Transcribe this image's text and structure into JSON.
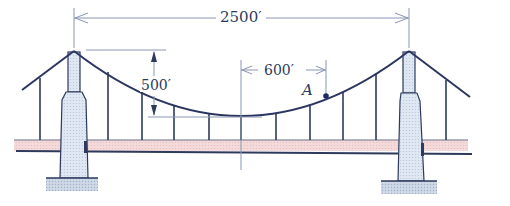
{
  "figure": {
    "type": "suspension-bridge-diagram",
    "dimensions": {
      "span_label": "2500′",
      "sag_label": "500′",
      "offset_label": "600′"
    },
    "point_label": "A",
    "colors": {
      "line": "#2d3a5c",
      "cable": "#2b3660",
      "deck_fill": "#f2d4d4",
      "tower_fill": "#d8e2f0",
      "footing_fill": "#c9d3e2",
      "dim_line": "#8a96b5"
    }
  }
}
